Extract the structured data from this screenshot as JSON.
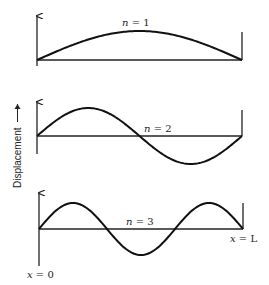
{
  "figure": {
    "y_axis_label": "Displacement",
    "x_start_label": "x = 0",
    "x_end_label": "x = L",
    "modes": [
      {
        "n": 1,
        "label_var": "n",
        "label_eq": " = 1"
      },
      {
        "n": 2,
        "label_var": "n",
        "label_eq": " = 2"
      },
      {
        "n": 3,
        "label_var": "n",
        "label_eq": " = 3"
      }
    ],
    "x_end_var": "x",
    "x_end_rest": " = L",
    "x_start_var": "x",
    "x_start_rest": " = 0"
  },
  "colors": {
    "line": "#111111",
    "background": "#ffffff"
  }
}
